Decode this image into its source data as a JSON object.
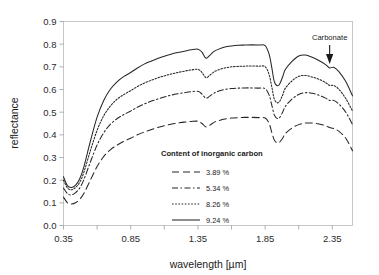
{
  "chart_data": {
    "type": "line",
    "title": "",
    "xlabel": "wavelength [µm]",
    "ylabel": "reflectance",
    "xlim": [
      0.35,
      2.5
    ],
    "ylim": [
      0.0,
      0.9
    ],
    "grid": false,
    "legend_position": "inside-center",
    "legend_title": "Content of inorganic carbon",
    "xticks": [
      "0.35",
      "0.85",
      "1.35",
      "1.85",
      "2.35"
    ],
    "xtick_values": [
      0.35,
      0.85,
      1.35,
      1.85,
      2.35
    ],
    "yticks": [
      "0.0",
      "0.1",
      "0.2",
      "0.3",
      "0.4",
      "0.5",
      "0.6",
      "0.7",
      "0.8",
      "0.9"
    ],
    "ytick_values": [
      0.0,
      0.1,
      0.2,
      0.3,
      0.4,
      0.5,
      0.6,
      0.7,
      0.8,
      0.9
    ],
    "annotations": [
      {
        "label": "Carbonate",
        "x": 2.33,
        "y": 0.695,
        "arrow": "down-arrow"
      }
    ],
    "series": [
      {
        "name": "3.89 %",
        "label": "3.89 %",
        "style": "long-dash",
        "dasharray": "7,4",
        "color": "#262626",
        "x": [
          0.35,
          0.38,
          0.41,
          0.44,
          0.47,
          0.5,
          0.55,
          0.6,
          0.65,
          0.7,
          0.75,
          0.8,
          0.85,
          0.9,
          0.95,
          1.0,
          1.05,
          1.1,
          1.15,
          1.2,
          1.25,
          1.3,
          1.35,
          1.38,
          1.41,
          1.44,
          1.47,
          1.5,
          1.55,
          1.6,
          1.65,
          1.7,
          1.75,
          1.8,
          1.85,
          1.88,
          1.9,
          1.92,
          1.95,
          1.98,
          2.0,
          2.05,
          2.1,
          2.15,
          2.2,
          2.25,
          2.3,
          2.33,
          2.36,
          2.4,
          2.45,
          2.5
        ],
        "y": [
          0.125,
          0.1,
          0.095,
          0.1,
          0.115,
          0.14,
          0.2,
          0.26,
          0.305,
          0.335,
          0.355,
          0.372,
          0.385,
          0.4,
          0.412,
          0.422,
          0.432,
          0.44,
          0.447,
          0.452,
          0.456,
          0.459,
          0.46,
          0.45,
          0.435,
          0.443,
          0.455,
          0.462,
          0.47,
          0.474,
          0.476,
          0.477,
          0.477,
          0.476,
          0.474,
          0.45,
          0.41,
          0.375,
          0.365,
          0.385,
          0.405,
          0.43,
          0.445,
          0.452,
          0.452,
          0.448,
          0.44,
          0.432,
          0.428,
          0.415,
          0.385,
          0.33
        ]
      },
      {
        "name": "5.34 %",
        "label": "5.34 %",
        "style": "dash-dot",
        "dasharray": "6,2.5,1.5,2.5",
        "color": "#262626",
        "x": [
          0.35,
          0.38,
          0.41,
          0.44,
          0.47,
          0.5,
          0.55,
          0.6,
          0.65,
          0.7,
          0.75,
          0.8,
          0.85,
          0.9,
          0.95,
          1.0,
          1.05,
          1.1,
          1.15,
          1.2,
          1.25,
          1.3,
          1.35,
          1.38,
          1.41,
          1.44,
          1.47,
          1.5,
          1.55,
          1.6,
          1.65,
          1.7,
          1.75,
          1.8,
          1.85,
          1.88,
          1.9,
          1.92,
          1.95,
          1.98,
          2.0,
          2.05,
          2.1,
          2.15,
          2.2,
          2.25,
          2.3,
          2.33,
          2.36,
          2.4,
          2.45,
          2.5
        ],
        "y": [
          0.165,
          0.14,
          0.135,
          0.145,
          0.165,
          0.2,
          0.28,
          0.355,
          0.41,
          0.447,
          0.472,
          0.49,
          0.505,
          0.522,
          0.536,
          0.548,
          0.558,
          0.567,
          0.575,
          0.581,
          0.586,
          0.59,
          0.592,
          0.58,
          0.562,
          0.572,
          0.584,
          0.592,
          0.6,
          0.604,
          0.606,
          0.607,
          0.607,
          0.606,
          0.604,
          0.575,
          0.53,
          0.485,
          0.472,
          0.5,
          0.525,
          0.558,
          0.578,
          0.586,
          0.583,
          0.575,
          0.562,
          0.552,
          0.552,
          0.535,
          0.5,
          0.445
        ]
      },
      {
        "name": "8.26 %",
        "label": "8.26 %",
        "style": "dotted",
        "dasharray": "1.6,1.6",
        "color": "#262626",
        "x": [
          0.35,
          0.38,
          0.41,
          0.44,
          0.47,
          0.5,
          0.55,
          0.6,
          0.65,
          0.7,
          0.75,
          0.8,
          0.85,
          0.9,
          0.95,
          1.0,
          1.05,
          1.1,
          1.15,
          1.2,
          1.25,
          1.3,
          1.35,
          1.38,
          1.41,
          1.44,
          1.47,
          1.5,
          1.55,
          1.6,
          1.65,
          1.7,
          1.75,
          1.8,
          1.85,
          1.88,
          1.9,
          1.92,
          1.95,
          1.98,
          2.0,
          2.05,
          2.1,
          2.15,
          2.2,
          2.25,
          2.3,
          2.33,
          2.36,
          2.4,
          2.45,
          2.5
        ],
        "y": [
          0.2,
          0.165,
          0.158,
          0.168,
          0.19,
          0.232,
          0.33,
          0.42,
          0.485,
          0.528,
          0.558,
          0.578,
          0.595,
          0.613,
          0.628,
          0.64,
          0.651,
          0.66,
          0.668,
          0.675,
          0.681,
          0.686,
          0.689,
          0.675,
          0.652,
          0.664,
          0.678,
          0.686,
          0.695,
          0.7,
          0.702,
          0.703,
          0.704,
          0.703,
          0.701,
          0.665,
          0.61,
          0.555,
          0.542,
          0.575,
          0.605,
          0.638,
          0.658,
          0.662,
          0.655,
          0.645,
          0.63,
          0.618,
          0.618,
          0.6,
          0.56,
          0.505
        ]
      },
      {
        "name": "9.24 %",
        "label": "9.24 %",
        "style": "solid",
        "dasharray": "none",
        "color": "#262626",
        "x": [
          0.35,
          0.38,
          0.41,
          0.44,
          0.47,
          0.5,
          0.55,
          0.6,
          0.65,
          0.7,
          0.75,
          0.8,
          0.85,
          0.9,
          0.95,
          1.0,
          1.05,
          1.1,
          1.15,
          1.2,
          1.25,
          1.3,
          1.35,
          1.38,
          1.41,
          1.44,
          1.47,
          1.5,
          1.55,
          1.6,
          1.65,
          1.7,
          1.75,
          1.8,
          1.85,
          1.88,
          1.9,
          1.92,
          1.95,
          1.98,
          2.0,
          2.05,
          2.1,
          2.15,
          2.2,
          2.25,
          2.3,
          2.33,
          2.36,
          2.4,
          2.45,
          2.5
        ],
        "y": [
          0.215,
          0.175,
          0.168,
          0.178,
          0.205,
          0.255,
          0.372,
          0.478,
          0.553,
          0.602,
          0.635,
          0.658,
          0.675,
          0.695,
          0.712,
          0.725,
          0.737,
          0.747,
          0.756,
          0.763,
          0.769,
          0.775,
          0.778,
          0.765,
          0.738,
          0.752,
          0.768,
          0.777,
          0.787,
          0.792,
          0.795,
          0.796,
          0.797,
          0.796,
          0.794,
          0.755,
          0.695,
          0.632,
          0.618,
          0.655,
          0.688,
          0.724,
          0.748,
          0.752,
          0.742,
          0.728,
          0.71,
          0.695,
          0.698,
          0.678,
          0.635,
          0.572
        ]
      }
    ]
  },
  "legend": {
    "title": "Content of inorganic carbon",
    "entries": [
      {
        "label": "3.89 %"
      },
      {
        "label": "5.34 %"
      },
      {
        "label": "8.26 %"
      },
      {
        "label": "9.24 %"
      }
    ]
  },
  "annotation": {
    "carbonate_label": "Carbonate"
  },
  "axes": {
    "x_title": "wavelength [µm]",
    "y_title": "reflectance"
  }
}
